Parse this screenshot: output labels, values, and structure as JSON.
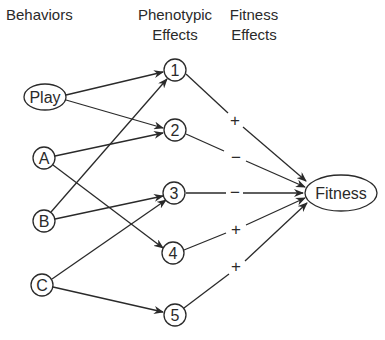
{
  "headers": {
    "behaviors": "Behaviors",
    "phenotypic_line1": "Phenotypic",
    "phenotypic_line2": "Effects",
    "fitness_line1": "Fitness",
    "fitness_line2": "Effects"
  },
  "behaviors": [
    {
      "id": "play",
      "label": "Play"
    },
    {
      "id": "a",
      "label": "A"
    },
    {
      "id": "b",
      "label": "B"
    },
    {
      "id": "c",
      "label": "C"
    }
  ],
  "phenotypic_effects": [
    {
      "id": "1",
      "label": "1"
    },
    {
      "id": "2",
      "label": "2"
    },
    {
      "id": "3",
      "label": "3"
    },
    {
      "id": "4",
      "label": "4"
    },
    {
      "id": "5",
      "label": "5"
    }
  ],
  "outcome": {
    "label": "Fitness"
  },
  "behavior_edges": [
    {
      "from": "Play",
      "to": "1"
    },
    {
      "from": "Play",
      "to": "2"
    },
    {
      "from": "A",
      "to": "2"
    },
    {
      "from": "A",
      "to": "4"
    },
    {
      "from": "B",
      "to": "1"
    },
    {
      "from": "B",
      "to": "3"
    },
    {
      "from": "C",
      "to": "3"
    },
    {
      "from": "C",
      "to": "5"
    }
  ],
  "fitness_edges": [
    {
      "from": "1",
      "to": "Fitness",
      "sign": "+"
    },
    {
      "from": "2",
      "to": "Fitness",
      "sign": "−"
    },
    {
      "from": "3",
      "to": "Fitness",
      "sign": "−"
    },
    {
      "from": "4",
      "to": "Fitness",
      "sign": "+"
    },
    {
      "from": "5",
      "to": "Fitness",
      "sign": "+"
    }
  ],
  "colors": {
    "ink": "#2a2a2a",
    "background": "#ffffff"
  }
}
